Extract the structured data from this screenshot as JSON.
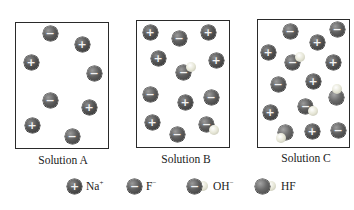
{
  "solutions": [
    {
      "label": "Solution A",
      "box": {
        "left": 15,
        "top": 22,
        "right": 109,
        "bottom": 149
      }
    },
    {
      "label": "Solution B",
      "box": {
        "left": 136,
        "top": 20,
        "right": 230,
        "bottom": 148
      }
    },
    {
      "label": "Solution C",
      "box": {
        "left": 257,
        "top": 19,
        "right": 350,
        "bottom": 148
      }
    }
  ],
  "legend": {
    "na": {
      "label": "Na",
      "charge": "+"
    },
    "f": {
      "label": "F",
      "charge": "−"
    },
    "oh": {
      "label": "OH",
      "charge": "−"
    },
    "hf": {
      "label": "HF"
    }
  },
  "signs": {
    "plus": "+",
    "minus": "−"
  },
  "particle_counts": {
    "Solution A": {
      "Na+": 4,
      "F-": 4,
      "OH-": 0,
      "HF": 0
    },
    "Solution B": {
      "Na+": 6,
      "F-": 4,
      "OH-": 2,
      "HF": 0
    },
    "Solution C": {
      "Na+": 5,
      "F-": 4,
      "OH-": 2,
      "HF": 2
    }
  }
}
